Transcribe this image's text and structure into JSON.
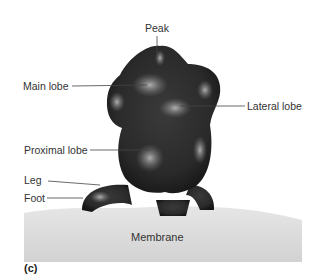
{
  "figure": {
    "panel_label": "(c)",
    "labels": {
      "peak": "Peak",
      "main_lobe": "Main lobe",
      "lateral_lobe": "Lateral lobe",
      "proximal_lobe": "Proximal lobe",
      "leg": "Leg",
      "foot": "Foot",
      "membrane": "Membrane"
    }
  }
}
